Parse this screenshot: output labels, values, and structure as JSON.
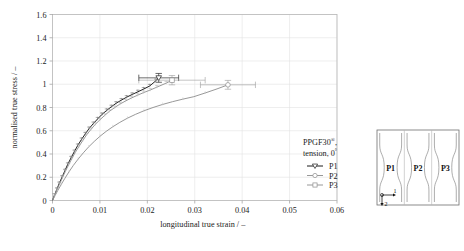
{
  "chart_data": {
    "type": "line",
    "title": "",
    "xlabel": "longitudinal true strain / –",
    "ylabel": "normalised true stress / –",
    "xlim": [
      0,
      0.06
    ],
    "ylim": [
      0,
      1.6
    ],
    "xticks": [
      "0",
      "0.01",
      "0.02",
      "0.03",
      "0.04",
      "0.05",
      "0.06"
    ],
    "xtick_values": [
      0,
      0.01,
      0.02,
      0.03,
      0.04,
      0.05,
      0.06
    ],
    "yticks": [
      "0",
      "0.2",
      "0.4",
      "0.6",
      "0.8",
      "1",
      "1.2",
      "1.4",
      "1.6"
    ],
    "ytick_values": [
      0,
      0.2,
      0.4,
      0.6,
      0.8,
      1,
      1.2,
      1.4,
      1.6
    ],
    "grid": true,
    "legend_position": "inside-lower-right",
    "series": [
      {
        "name": "P1",
        "marker": "triangle-down",
        "color": "#1b1b1b",
        "x": [
          0,
          0.0004,
          0.0009,
          0.0014,
          0.002,
          0.0026,
          0.0032,
          0.0039,
          0.0046,
          0.0053,
          0.0061,
          0.0069,
          0.0077,
          0.0086,
          0.0095,
          0.0104,
          0.0114,
          0.0124,
          0.0134,
          0.0145,
          0.0156,
          0.0168,
          0.018,
          0.0192,
          0.0205,
          0.0218,
          0.0224
        ],
        "y": [
          0,
          0.045,
          0.095,
          0.145,
          0.2,
          0.255,
          0.31,
          0.366,
          0.42,
          0.472,
          0.524,
          0.572,
          0.618,
          0.661,
          0.701,
          0.739,
          0.774,
          0.806,
          0.836,
          0.863,
          0.888,
          0.912,
          0.935,
          0.958,
          0.985,
          1.03,
          1.055
        ],
        "endpoint": {
          "x": 0.0224,
          "y": 1.055
        },
        "xerr": 0.0042,
        "yerr": 0.038
      },
      {
        "name": "P2",
        "marker": "circle",
        "color": "#8c8c8c",
        "x": [
          0,
          0.0005,
          0.0011,
          0.0018,
          0.0026,
          0.0035,
          0.0044,
          0.0054,
          0.0065,
          0.0076,
          0.0088,
          0.01,
          0.0113,
          0.0127,
          0.0142,
          0.0158,
          0.0175,
          0.0193,
          0.0212,
          0.0232,
          0.0253,
          0.0275,
          0.0298,
          0.0322,
          0.0347,
          0.037
        ],
        "y": [
          0,
          0.04,
          0.085,
          0.135,
          0.19,
          0.248,
          0.302,
          0.356,
          0.41,
          0.46,
          0.508,
          0.552,
          0.594,
          0.634,
          0.672,
          0.708,
          0.741,
          0.772,
          0.8,
          0.826,
          0.85,
          0.872,
          0.893,
          0.925,
          0.96,
          0.995
        ],
        "endpoint": {
          "x": 0.037,
          "y": 0.995
        },
        "xerr": 0.0058,
        "yerr": 0.038
      },
      {
        "name": "P3",
        "marker": "square",
        "color": "#8c8c8c",
        "x": [
          0,
          0.0004,
          0.0009,
          0.0015,
          0.0021,
          0.0027,
          0.0034,
          0.0041,
          0.0048,
          0.0056,
          0.0064,
          0.0072,
          0.0081,
          0.009,
          0.01,
          0.011,
          0.012,
          0.0131,
          0.0142,
          0.0154,
          0.0166,
          0.0179,
          0.0192,
          0.0206,
          0.022,
          0.024,
          0.0252
        ],
        "y": [
          0,
          0.044,
          0.093,
          0.143,
          0.197,
          0.251,
          0.306,
          0.361,
          0.414,
          0.466,
          0.517,
          0.565,
          0.611,
          0.654,
          0.694,
          0.732,
          0.767,
          0.799,
          0.829,
          0.856,
          0.881,
          0.905,
          0.928,
          0.95,
          0.975,
          1.01,
          1.035
        ],
        "endpoint": {
          "x": 0.0252,
          "y": 1.035
        },
        "xerr": 0.007,
        "yerr": 0.04
      }
    ],
    "legend": {
      "title_line1": "PPGF30",
      "title_sup": "®",
      "title_line1_tail": ",",
      "title_line2": "tension, 0",
      "title_line2_sup": "°",
      "entries": [
        {
          "label": "P1",
          "marker": "triangle-down"
        },
        {
          "label": "P2",
          "marker": "circle"
        },
        {
          "label": "P3",
          "marker": "square"
        }
      ]
    }
  },
  "inset": {
    "name": "specimen-plate-diagram",
    "specimens": [
      "P1",
      "P2",
      "P3"
    ],
    "axis_1": "1",
    "axis_2": "2"
  }
}
